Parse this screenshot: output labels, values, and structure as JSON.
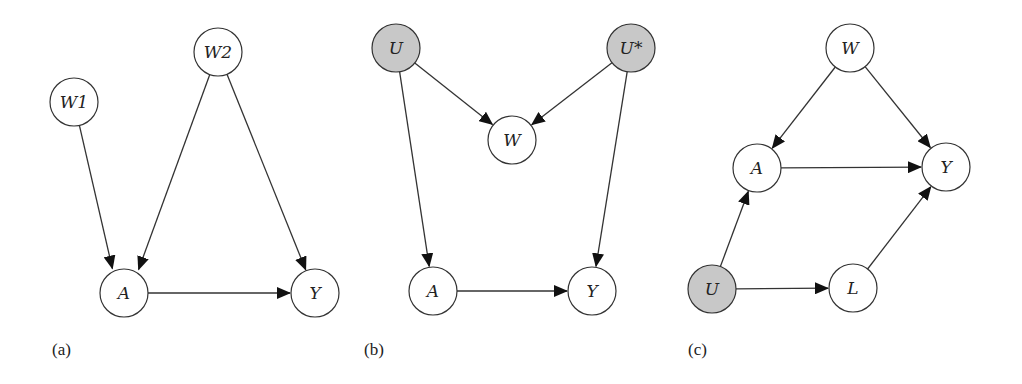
{
  "colors": {
    "node_fill": "#ffffff",
    "latent_fill": "#c8c8c8",
    "stroke": "#333333"
  },
  "node_radius": 24,
  "panels": [
    {
      "id": "a",
      "label": "(a)",
      "label_pos": [
        52,
        355
      ],
      "nodes": [
        {
          "id": "W1",
          "label": "W1",
          "x": 74,
          "y": 102,
          "latent": false
        },
        {
          "id": "W2",
          "label": "W2",
          "x": 218,
          "y": 52,
          "latent": false
        },
        {
          "id": "A",
          "label": "A",
          "x": 124,
          "y": 293,
          "latent": false
        },
        {
          "id": "Y",
          "label": "Y",
          "x": 315,
          "y": 293,
          "latent": false
        }
      ],
      "edges": [
        {
          "from": "W1",
          "to": "A",
          "end_dx": -6
        },
        {
          "from": "W2",
          "to": "A",
          "end_dx": 6
        },
        {
          "from": "W2",
          "to": "Y"
        },
        {
          "from": "A",
          "to": "Y"
        }
      ]
    },
    {
      "id": "b",
      "label": "(b)",
      "label_pos": [
        364,
        355
      ],
      "nodes": [
        {
          "id": "U",
          "label": "U",
          "x": 396,
          "y": 48,
          "latent": true
        },
        {
          "id": "Ustar",
          "label": "U*",
          "x": 631,
          "y": 48,
          "latent": true
        },
        {
          "id": "W",
          "label": "W",
          "x": 512,
          "y": 140,
          "latent": false
        },
        {
          "id": "A",
          "label": "A",
          "x": 433,
          "y": 291,
          "latent": false
        },
        {
          "id": "Y",
          "label": "Y",
          "x": 592,
          "y": 291,
          "latent": false
        }
      ],
      "edges": [
        {
          "from": "U",
          "to": "W"
        },
        {
          "from": "Ustar",
          "to": "W"
        },
        {
          "from": "U",
          "to": "A"
        },
        {
          "from": "Ustar",
          "to": "Y"
        },
        {
          "from": "A",
          "to": "Y"
        }
      ]
    },
    {
      "id": "c",
      "label": "(c)",
      "label_pos": [
        688,
        355
      ],
      "nodes": [
        {
          "id": "W",
          "label": "W",
          "x": 850,
          "y": 48,
          "latent": false
        },
        {
          "id": "A",
          "label": "A",
          "x": 757,
          "y": 168,
          "latent": false
        },
        {
          "id": "Y",
          "label": "Y",
          "x": 946,
          "y": 167,
          "latent": false
        },
        {
          "id": "U",
          "label": "U",
          "x": 712,
          "y": 289,
          "latent": true
        },
        {
          "id": "L",
          "label": "L",
          "x": 853,
          "y": 288,
          "latent": false
        }
      ],
      "edges": [
        {
          "from": "W",
          "to": "A"
        },
        {
          "from": "W",
          "to": "Y"
        },
        {
          "from": "A",
          "to": "Y"
        },
        {
          "from": "U",
          "to": "A"
        },
        {
          "from": "U",
          "to": "L"
        },
        {
          "from": "L",
          "to": "Y"
        }
      ]
    }
  ]
}
